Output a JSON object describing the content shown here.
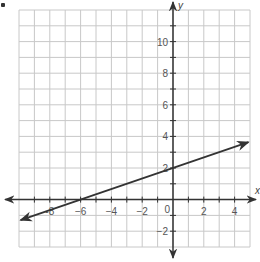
{
  "chart_data": {
    "type": "line",
    "title": "",
    "xlabel": "x",
    "ylabel": "y",
    "xlim": [
      -10,
      5
    ],
    "ylim": [
      -3,
      12
    ],
    "grid": true,
    "grid_step": 1,
    "x_ticks": [
      -8,
      -6,
      -4,
      -2,
      2,
      4
    ],
    "x_tick_labels": [
      "-8",
      "−6",
      "−4",
      "−2",
      "2",
      "4"
    ],
    "y_ticks": [
      10,
      8,
      6,
      4,
      2,
      -2
    ],
    "y_tick_labels": [
      "10",
      "8",
      "6",
      "4",
      "2",
      "−2"
    ],
    "origin_label": "0",
    "series": [
      {
        "name": "line",
        "equation": "y = (1/3)x + 2",
        "slope": 0.3333,
        "intercept": 2,
        "points": [
          [
            -6,
            0
          ],
          [
            0,
            2
          ]
        ],
        "x_start": -10,
        "x_end": 5,
        "arrows": "both",
        "color": "#333333"
      }
    ]
  },
  "colors": {
    "grid": "#c8c8c8",
    "axis": "#333333",
    "line": "#333333"
  }
}
